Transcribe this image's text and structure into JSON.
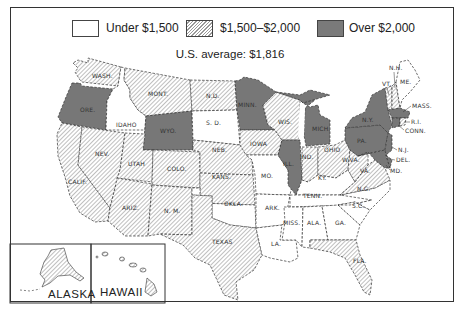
{
  "legend": {
    "items": [
      {
        "label": "Under $1,500",
        "fill": "white"
      },
      {
        "label": "$1,500–$2,000",
        "fill": "hatched"
      },
      {
        "label": "Over $2,000",
        "fill": "#7a7a7a"
      }
    ]
  },
  "average": "U.S. average:  $1,816",
  "colors": {
    "under": "#ffffff",
    "mid_hatch": "#8a8a8a",
    "over": "#777777",
    "border": "#333333"
  },
  "states": {
    "wash": {
      "label": "WASH.",
      "category": "mid"
    },
    "ore": {
      "label": "ORE.",
      "category": "over"
    },
    "calif": {
      "label": "CALIF.",
      "category": "mid"
    },
    "idaho": {
      "label": "IDAHO",
      "category": "under"
    },
    "nev": {
      "label": "NEV.",
      "category": "mid"
    },
    "mont": {
      "label": "MONT.",
      "category": "mid"
    },
    "wyo": {
      "label": "WYO.",
      "category": "over"
    },
    "utah": {
      "label": "UTAH",
      "category": "mid"
    },
    "colo": {
      "label": "COLO.",
      "category": "mid"
    },
    "ariz": {
      "label": "ARIZ.",
      "category": "mid"
    },
    "nm": {
      "label": "N. M.",
      "category": "mid"
    },
    "nd": {
      "label": "N.D.",
      "category": "mid"
    },
    "sd": {
      "label": "S. D.",
      "category": "under"
    },
    "neb": {
      "label": "NEB.",
      "category": "mid"
    },
    "kans": {
      "label": "KANS.",
      "category": "mid"
    },
    "okla": {
      "label": "OKLA.",
      "category": "under"
    },
    "texas": {
      "label": "TEXAS",
      "category": "mid"
    },
    "minn": {
      "label": "MINN.",
      "category": "over"
    },
    "iowa": {
      "label": "IOWA",
      "category": "mid"
    },
    "mo": {
      "label": "MO.",
      "category": "under"
    },
    "ark": {
      "label": "ARK.",
      "category": "under"
    },
    "la": {
      "label": "LA.",
      "category": "under"
    },
    "wis": {
      "label": "WIS.",
      "category": "mid"
    },
    "ill": {
      "label": "ILL.",
      "category": "over"
    },
    "mich": {
      "label": "MICH.",
      "category": "over"
    },
    "ind": {
      "label": "IND.",
      "category": "mid"
    },
    "ohio": {
      "label": "OHIO",
      "category": "mid"
    },
    "ky": {
      "label": "KY.",
      "category": "under"
    },
    "tenn": {
      "label": "TENN.",
      "category": "under"
    },
    "miss": {
      "label": "MISS.",
      "category": "under"
    },
    "ala": {
      "label": "ALA.",
      "category": "under"
    },
    "ga": {
      "label": "GA.",
      "category": "under"
    },
    "fla": {
      "label": "FLA.",
      "category": "mid"
    },
    "sc": {
      "label": "S.C.",
      "category": "under"
    },
    "nc": {
      "label": "N.C.",
      "category": "under"
    },
    "va": {
      "label": "VA.",
      "category": "mid"
    },
    "wva": {
      "label": "W.VA.",
      "category": "mid"
    },
    "md": {
      "label": "MD.",
      "category": "over"
    },
    "del": {
      "label": "DEL.",
      "category": "over"
    },
    "nj": {
      "label": "N.J.",
      "category": "over"
    },
    "pa": {
      "label": "PA.",
      "category": "over"
    },
    "ny": {
      "label": "N.Y.",
      "category": "over"
    },
    "conn": {
      "label": "CONN.",
      "category": "over"
    },
    "ri": {
      "label": "R.I.",
      "category": "mid"
    },
    "mass": {
      "label": "MASS.",
      "category": "over"
    },
    "vt": {
      "label": "VT.",
      "category": "mid"
    },
    "nh": {
      "label": "N.H.",
      "category": "mid"
    },
    "me": {
      "label": "ME.",
      "category": "under"
    },
    "alaska": {
      "label": "ALASKA",
      "category": "mid"
    },
    "hawaii": {
      "label": "HAWAII",
      "category": "mid"
    }
  }
}
